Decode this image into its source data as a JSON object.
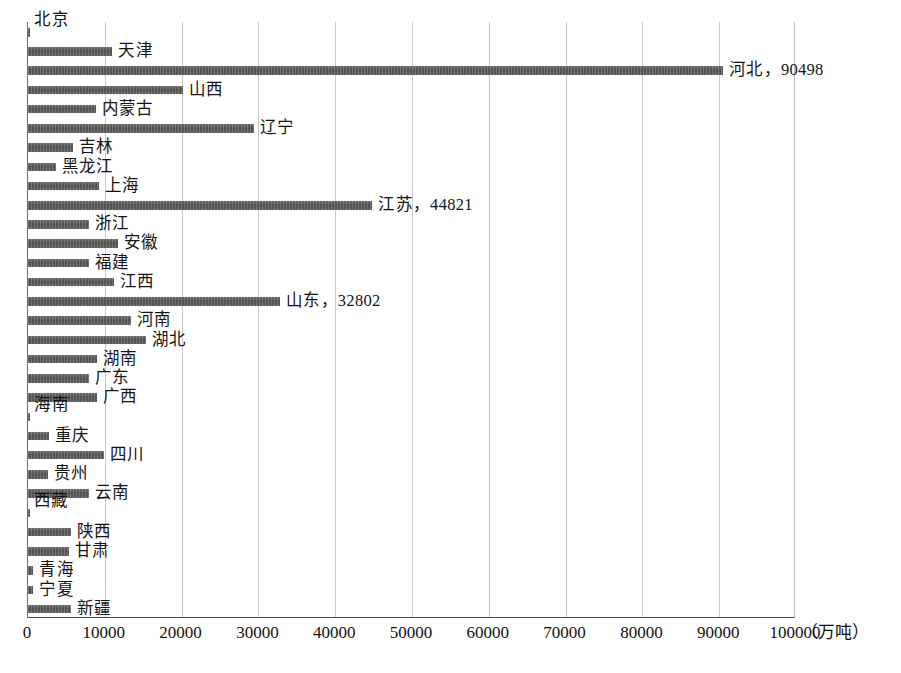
{
  "chart_data": {
    "type": "bar",
    "orientation": "horizontal",
    "title": "",
    "xlabel": "（万吨）",
    "ylabel": "",
    "unit": "万吨",
    "xlim": [
      0,
      100000
    ],
    "xtick_step": 10000,
    "grid": true,
    "legend": "none",
    "bar_color": "#555555",
    "categories": [
      "北京",
      "天津",
      "河北",
      "山西",
      "内蒙古",
      "辽宁",
      "吉林",
      "黑龙江",
      "上海",
      "江苏",
      "浙江",
      "安徽",
      "福建",
      "江西",
      "山东",
      "河南",
      "湖北",
      "湖南",
      "广东",
      "广西",
      "海南",
      "重庆",
      "四川",
      "贵州",
      "云南",
      "西藏",
      "陕西",
      "甘肃",
      "青海",
      "宁夏",
      "新疆"
    ],
    "values": [
      300,
      11000,
      90498,
      20200,
      8800,
      29400,
      5800,
      3600,
      9200,
      44821,
      7900,
      11700,
      7900,
      11200,
      32802,
      13400,
      15300,
      9000,
      7900,
      9000,
      300,
      2700,
      9900,
      2600,
      7900,
      200,
      5600,
      5300,
      700,
      700,
      5600
    ],
    "tick_labels": [
      "0",
      "10000",
      "20000",
      "30000",
      "40000",
      "50000",
      "60000",
      "70000",
      "80000",
      "90000",
      "100000"
    ],
    "data_labels": [
      {
        "category": "北京",
        "text": "北京",
        "position": "above"
      },
      {
        "category": "天津",
        "text": "天津",
        "position": "right"
      },
      {
        "category": "河北",
        "text": "河北，90498",
        "position": "right"
      },
      {
        "category": "山西",
        "text": "山西",
        "position": "right"
      },
      {
        "category": "内蒙古",
        "text": "内蒙古",
        "position": "right"
      },
      {
        "category": "辽宁",
        "text": "辽宁",
        "position": "right"
      },
      {
        "category": "吉林",
        "text": "吉林",
        "position": "right"
      },
      {
        "category": "黑龙江",
        "text": "黑龙江",
        "position": "right"
      },
      {
        "category": "上海",
        "text": "上海",
        "position": "right"
      },
      {
        "category": "江苏",
        "text": "江苏，44821",
        "position": "right"
      },
      {
        "category": "浙江",
        "text": "浙江",
        "position": "right"
      },
      {
        "category": "安徽",
        "text": "安徽",
        "position": "right"
      },
      {
        "category": "福建",
        "text": "福建",
        "position": "right"
      },
      {
        "category": "江西",
        "text": "江西",
        "position": "right"
      },
      {
        "category": "山东",
        "text": "山东，32802",
        "position": "right"
      },
      {
        "category": "河南",
        "text": "河南",
        "position": "right"
      },
      {
        "category": "湖北",
        "text": "湖北",
        "position": "right"
      },
      {
        "category": "湖南",
        "text": "湖南",
        "position": "right"
      },
      {
        "category": "广东",
        "text": "广东",
        "position": "right"
      },
      {
        "category": "广西",
        "text": "广西",
        "position": "right"
      },
      {
        "category": "海南",
        "text": "海南",
        "position": "above"
      },
      {
        "category": "重庆",
        "text": "重庆",
        "position": "right"
      },
      {
        "category": "四川",
        "text": "四川",
        "position": "right"
      },
      {
        "category": "贵州",
        "text": "贵州",
        "position": "right"
      },
      {
        "category": "云南",
        "text": "云南",
        "position": "right"
      },
      {
        "category": "西藏",
        "text": "西藏",
        "position": "above"
      },
      {
        "category": "陕西",
        "text": "陕西",
        "position": "right"
      },
      {
        "category": "甘肃",
        "text": "甘肃",
        "position": "right"
      },
      {
        "category": "青海",
        "text": "青海",
        "position": "right"
      },
      {
        "category": "宁夏",
        "text": "宁夏",
        "position": "right"
      },
      {
        "category": "新疆",
        "text": "新疆",
        "position": "right"
      }
    ]
  }
}
